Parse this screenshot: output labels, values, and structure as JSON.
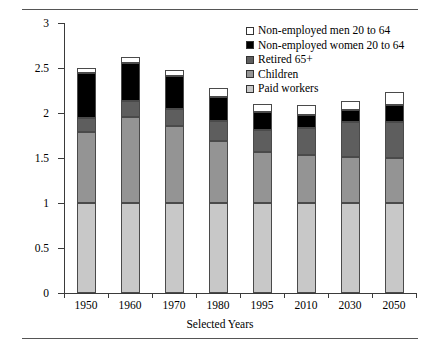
{
  "chart_data": {
    "type": "bar",
    "stacked": true,
    "title": "",
    "xlabel": "Selected Years",
    "ylabel": "Number of Persons Supported by Each Worker",
    "categories": [
      "1950",
      "1960",
      "1970",
      "1980",
      "1995",
      "2010",
      "2030",
      "2050"
    ],
    "ylim": [
      0,
      3
    ],
    "yticks": [
      "0",
      "0.5",
      "1",
      "1.5",
      "2",
      "2.5",
      "3"
    ],
    "ytick_values": [
      0,
      0.5,
      1,
      1.5,
      2,
      2.5,
      3
    ],
    "grid": false,
    "legend_position": "top-right",
    "series": [
      {
        "name": "Paid workers",
        "color": "#c8c8c8",
        "values": [
          1.0,
          1.0,
          1.0,
          1.0,
          1.0,
          1.0,
          1.0,
          1.0
        ]
      },
      {
        "name": "Children",
        "color": "#949494",
        "values": [
          0.79,
          0.96,
          0.86,
          0.69,
          0.57,
          0.53,
          0.51,
          0.5
        ]
      },
      {
        "name": "Retired 65+",
        "color": "#5e5e5e",
        "values": [
          0.16,
          0.17,
          0.19,
          0.22,
          0.24,
          0.3,
          0.39,
          0.4
        ]
      },
      {
        "name": "Non-employed women 20 to 64",
        "color": "#000000",
        "values": [
          0.49,
          0.43,
          0.36,
          0.27,
          0.2,
          0.15,
          0.13,
          0.19
        ]
      },
      {
        "name": "Non-employed men 20 to 64",
        "color": "#ffffff",
        "values": [
          0.06,
          0.06,
          0.07,
          0.1,
          0.09,
          0.11,
          0.1,
          0.14
        ]
      }
    ],
    "totals": [
      2.5,
      2.62,
      2.48,
      2.28,
      2.1,
      2.09,
      2.13,
      2.23
    ],
    "legend_order": [
      "Non-employed men 20 to 64",
      "Non-employed women 20 to 64",
      "Retired 65+",
      "Children",
      "Paid workers"
    ]
  }
}
